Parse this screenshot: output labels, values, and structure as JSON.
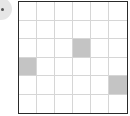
{
  "marker": {
    "icon": "bullet-circle-icon"
  },
  "grid": {
    "rows": 6,
    "cols": 6,
    "shaded_color": "#c4c4c4",
    "empty_color": "#ffffff",
    "border_color": "#2a2a2a",
    "line_color": "#d6d6d6",
    "shaded_cells": [
      {
        "row": 2,
        "col": 3
      },
      {
        "row": 3,
        "col": 0
      },
      {
        "row": 4,
        "col": 5
      }
    ]
  }
}
